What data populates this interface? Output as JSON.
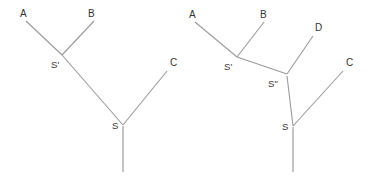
{
  "figure": {
    "title": "",
    "background_color": "#ffffff",
    "line_color": "#9a9a9a",
    "text_color": "#333333",
    "diagrams": [
      {
        "name": "left-tree",
        "leaf_labels": [
          "A",
          "B",
          "C"
        ],
        "internal_labels": [
          "S'",
          "S"
        ],
        "leaves": [
          {
            "label": "A",
            "x": 20,
            "y": 9
          },
          {
            "label": "B",
            "x": 88,
            "y": 9
          },
          {
            "label": "C",
            "x": 170,
            "y": 58
          }
        ],
        "nodes": [
          {
            "label": "S'",
            "x": 51,
            "y": 60
          },
          {
            "label": "S",
            "x": 112,
            "y": 121
          }
        ],
        "edges": [
          {
            "from": "A",
            "to": "S'",
            "x1": 26,
            "y1": 21,
            "x2": 62,
            "y2": 55
          },
          {
            "from": "B",
            "to": "S'",
            "x1": 94,
            "y1": 21,
            "x2": 62,
            "y2": 55
          },
          {
            "from": "S'",
            "to": "S",
            "x1": 62,
            "y1": 55,
            "x2": 123,
            "y2": 125
          },
          {
            "from": "C",
            "to": "S",
            "x1": 167,
            "y1": 71,
            "x2": 123,
            "y2": 125
          },
          {
            "from": "S",
            "to": "root",
            "x1": 123,
            "y1": 126,
            "x2": 123,
            "y2": 172
          }
        ]
      },
      {
        "name": "right-tree",
        "leaf_labels": [
          "A",
          "B",
          "D",
          "C"
        ],
        "internal_labels": [
          "S'",
          "S\"",
          "S"
        ],
        "leaves": [
          {
            "label": "A",
            "x": 189,
            "y": 10
          },
          {
            "label": "B",
            "x": 260,
            "y": 10
          },
          {
            "label": "D",
            "x": 315,
            "y": 23
          },
          {
            "label": "C",
            "x": 346,
            "y": 58
          }
        ],
        "nodes": [
          {
            "label": "S'",
            "x": 224,
            "y": 62
          },
          {
            "label": "S\"",
            "x": 268,
            "y": 79
          },
          {
            "label": "S",
            "x": 282,
            "y": 122
          }
        ],
        "edges": [
          {
            "from": "A",
            "to": "S'",
            "x1": 195,
            "y1": 22,
            "x2": 237,
            "y2": 57
          },
          {
            "from": "B",
            "to": "S'",
            "x1": 264,
            "y1": 22,
            "x2": 237,
            "y2": 57
          },
          {
            "from": "S'",
            "to": "S\"",
            "x1": 237,
            "y1": 57,
            "x2": 287,
            "y2": 74
          },
          {
            "from": "D",
            "to": "S\"",
            "x1": 313,
            "y1": 36,
            "x2": 287,
            "y2": 74
          },
          {
            "from": "S\"",
            "to": "S",
            "x1": 287,
            "y1": 76,
            "x2": 293,
            "y2": 126
          },
          {
            "from": "C",
            "to": "S",
            "x1": 343,
            "y1": 71,
            "x2": 293,
            "y2": 126
          },
          {
            "from": "S",
            "to": "root",
            "x1": 293,
            "y1": 127,
            "x2": 293,
            "y2": 172
          }
        ]
      }
    ]
  }
}
